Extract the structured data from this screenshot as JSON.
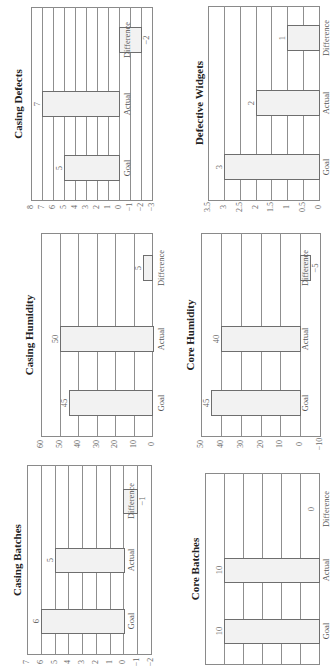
{
  "chart_data": [
    {
      "id": "casing-defects",
      "type": "bar",
      "title": "Casing Defects",
      "categories": [
        "Goal",
        "Actual",
        "Difference"
      ],
      "values": [
        5,
        7,
        -2
      ],
      "value_labels": [
        "5",
        "7",
        "−2"
      ],
      "xlabel": "",
      "ylabel": "",
      "ylim": [
        -3,
        8
      ],
      "yticks": [
        8,
        7,
        6,
        5,
        4,
        3,
        2,
        1,
        0,
        -1,
        -2,
        -3
      ],
      "ytick_labels": [
        "8",
        "7",
        "6",
        "5",
        "4",
        "3",
        "2",
        "1",
        "0",
        "−1",
        "−2",
        "−3"
      ],
      "grid": true,
      "legend": "none",
      "orientation": "rotated -90deg"
    },
    {
      "id": "defective-widgets",
      "type": "bar",
      "title": "Defective Widgets",
      "categories": [
        "Goal",
        "Actual",
        "Difference"
      ],
      "values": [
        3,
        2,
        1
      ],
      "value_labels": [
        "3",
        "2",
        "1"
      ],
      "xlabel": "",
      "ylabel": "",
      "ylim": [
        0,
        3.5
      ],
      "yticks": [
        3.5,
        3,
        2.5,
        2,
        1.5,
        1,
        0.5,
        0
      ],
      "ytick_labels": [
        "3.5",
        "3",
        "2.5",
        "2",
        "1.5",
        "1",
        "0.5",
        "0"
      ],
      "grid": true,
      "legend": "none",
      "orientation": "rotated -90deg"
    },
    {
      "id": "casing-humidity",
      "type": "bar",
      "title": "Casing Humidity",
      "categories": [
        "Goal",
        "Actual",
        "Difference"
      ],
      "values": [
        45,
        50,
        5
      ],
      "value_labels": [
        "45",
        "50",
        "5"
      ],
      "xlabel": "",
      "ylabel": "",
      "ylim": [
        0,
        60
      ],
      "yticks": [
        60,
        50,
        40,
        30,
        20,
        10,
        0
      ],
      "ytick_labels": [
        "60",
        "50",
        "40",
        "30",
        "20",
        "10",
        "0"
      ],
      "grid": true,
      "legend": "none",
      "orientation": "rotated -90deg"
    },
    {
      "id": "core-humidity",
      "type": "bar",
      "title": "Core Humidity",
      "categories": [
        "Goal",
        "Actual",
        "Difference"
      ],
      "values": [
        45,
        40,
        -5
      ],
      "value_labels": [
        "45",
        "40",
        "−5"
      ],
      "xlabel": "",
      "ylabel": "",
      "ylim": [
        -10,
        50
      ],
      "yticks": [
        50,
        40,
        30,
        20,
        10,
        0,
        -10
      ],
      "ytick_labels": [
        "50",
        "40",
        "30",
        "20",
        "10",
        "0",
        "−10"
      ],
      "grid": true,
      "legend": "none",
      "orientation": "rotated -90deg"
    },
    {
      "id": "casing-batches",
      "type": "bar",
      "title": "Casing Batches",
      "categories": [
        "Goal",
        "Actual",
        "Difference"
      ],
      "values": [
        6,
        5,
        -1
      ],
      "value_labels": [
        "6",
        "5",
        "−1"
      ],
      "xlabel": "",
      "ylabel": "",
      "ylim": [
        -2,
        7
      ],
      "yticks": [
        7,
        6,
        5,
        4,
        3,
        2,
        1,
        0,
        -1,
        -2
      ],
      "ytick_labels": [
        "7",
        "6",
        "5",
        "4",
        "3",
        "2",
        "1",
        "0",
        "−1",
        "−2"
      ],
      "grid": true,
      "legend": "none",
      "orientation": "rotated -90deg"
    },
    {
      "id": "core-batches",
      "type": "bar",
      "title": "Core Batches",
      "categories": [
        "Goal",
        "Actual",
        "Difference"
      ],
      "values": [
        10,
        10,
        0
      ],
      "value_labels": [
        "10",
        "10",
        "0"
      ],
      "xlabel": "",
      "ylabel": "",
      "ylim": [
        0,
        12
      ],
      "yticks": [
        12,
        10,
        8,
        6,
        4,
        2,
        0
      ],
      "ytick_labels": [
        "12",
        "10",
        "8",
        "6",
        "4",
        "2",
        "0"
      ],
      "grid": true,
      "legend": "none",
      "orientation": "rotated -90deg"
    }
  ],
  "style": {
    "bar_fill": "#f2f2f2",
    "bar_border": "#6e6e6e",
    "grid_color": "#8f8f8f",
    "background": "#ffffff"
  }
}
